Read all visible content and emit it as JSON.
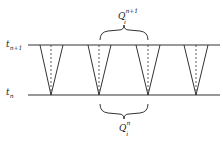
{
  "diagram": {
    "labels": {
      "top_line": {
        "base": "t",
        "sub": "n+1"
      },
      "bottom_line": {
        "base": "t",
        "sub": "n"
      },
      "top_brace": {
        "base": "Q",
        "sub": "i",
        "sup": "n+1"
      },
      "bottom_brace": {
        "base": "Q",
        "sub": "i",
        "sup": "n"
      }
    },
    "lines": {
      "top_y": 45,
      "bottom_y": 95,
      "x_start": 28,
      "x_end": 220
    },
    "cones": [
      {
        "apex_x": 51,
        "half_width": 12
      },
      {
        "apex_x": 99,
        "half_width": 12
      },
      {
        "apex_x": 148,
        "half_width": 12
      },
      {
        "apex_x": 196,
        "half_width": 12
      }
    ],
    "colors": {
      "stroke": "#333333",
      "background": "#ffffff"
    }
  }
}
